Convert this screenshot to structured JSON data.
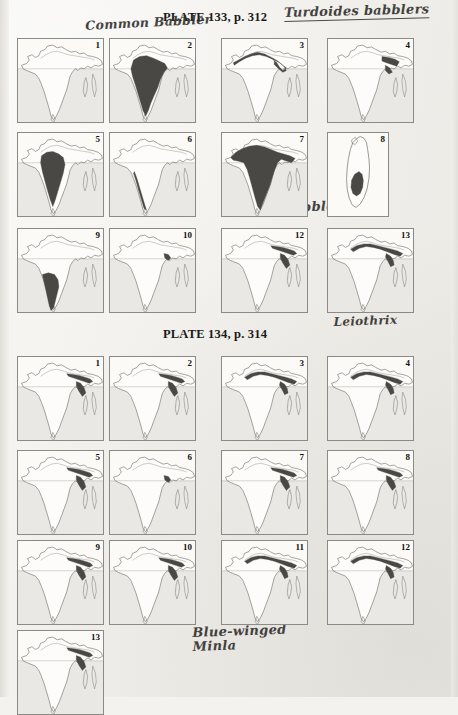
{
  "page": {
    "background_color": "#f3f2ee",
    "type": "scanned-book-page"
  },
  "plates": [
    {
      "id": "plate-133",
      "title": "PLATE 133, p. 312",
      "annotations": [
        {
          "name": "turdoides-babblers",
          "text": "Turdoides babblers",
          "underlined": true
        },
        {
          "name": "common-babbler",
          "text": "Common Babbler",
          "underlined": false
        },
        {
          "name": "large-grey",
          "text": "Large grey",
          "underlined": false
        },
        {
          "name": "jungle-babbler",
          "text": "Jungle Babbler",
          "underlined": false
        },
        {
          "name": "red-billed-leiothrix",
          "text": "Red-billed\nLeiothrix",
          "underlined": false
        }
      ],
      "maps": [
        {
          "num": "1",
          "region": "india",
          "shading": "none"
        },
        {
          "num": "2",
          "region": "india",
          "shading": "peninsular-broad"
        },
        {
          "num": "3",
          "region": "india",
          "shading": "indus-gangetic-band"
        },
        {
          "num": "4",
          "region": "india",
          "shading": "northeast-small"
        },
        {
          "num": "5",
          "region": "india",
          "shading": "central-peninsular"
        },
        {
          "num": "6",
          "region": "india",
          "shading": "western-ghats-thin"
        },
        {
          "num": "7",
          "region": "india",
          "shading": "subcontinent-wide"
        },
        {
          "num": "8",
          "region": "sri-lanka",
          "shading": "srilanka-central"
        },
        {
          "num": "9",
          "region": "india",
          "shading": "south-peninsular"
        },
        {
          "num": "10",
          "region": "india",
          "shading": "point-northeast"
        },
        {
          "num": "12",
          "region": "india",
          "shading": "himalaya-east"
        },
        {
          "num": "13",
          "region": "india",
          "shading": "himalaya-arc"
        }
      ]
    },
    {
      "id": "plate-134",
      "title": "PLATE 134, p. 314",
      "annotations": [
        {
          "name": "blue-winged-minla",
          "text": "Blue-winged\nMinla",
          "underlined": false
        }
      ],
      "maps": [
        {
          "num": "1",
          "region": "india",
          "shading": "himalaya-east"
        },
        {
          "num": "2",
          "region": "india",
          "shading": "himalaya-east"
        },
        {
          "num": "3",
          "region": "india",
          "shading": "himalaya-arc"
        },
        {
          "num": "4",
          "region": "india",
          "shading": "himalaya-arc"
        },
        {
          "num": "5",
          "region": "india",
          "shading": "himalaya-east"
        },
        {
          "num": "6",
          "region": "india",
          "shading": "point-northeast"
        },
        {
          "num": "7",
          "region": "india",
          "shading": "himalaya-east"
        },
        {
          "num": "8",
          "region": "india",
          "shading": "himalaya-east"
        },
        {
          "num": "9",
          "region": "india",
          "shading": "himalaya-east"
        },
        {
          "num": "10",
          "region": "india",
          "shading": "himalaya-east"
        },
        {
          "num": "11",
          "region": "india",
          "shading": "himalaya-arc"
        },
        {
          "num": "12",
          "region": "india",
          "shading": "himalaya-arc"
        },
        {
          "num": "13",
          "region": "india",
          "shading": "himalaya-east"
        }
      ]
    }
  ],
  "colors": {
    "range_fill": "#4a4844",
    "coast_line": "#6e6c66",
    "panel_border": "#8c8a84",
    "ink": "#1c1b19"
  }
}
